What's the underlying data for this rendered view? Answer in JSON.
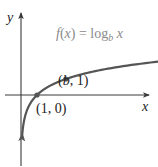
{
  "chart_data": {
    "type": "line",
    "title": "",
    "function_label": {
      "prefix": "f(x) = log",
      "subscript": "b",
      "suffix": " x"
    },
    "xlabel": "x",
    "ylabel": "y",
    "series": [
      {
        "name": "f(x) = log_b x",
        "base": 2.8,
        "x_range": [
          0.08,
          9.5
        ]
      }
    ],
    "points": [
      {
        "label": "(1, 0)",
        "x": 1,
        "y": 0
      },
      {
        "label": "(b, 1)",
        "x": "b",
        "y": 1
      }
    ],
    "grid": false,
    "colors": {
      "axis": "#3a3a3a",
      "curve": "#555555",
      "function_label": "#8a8a8a",
      "text": "#222222"
    }
  }
}
